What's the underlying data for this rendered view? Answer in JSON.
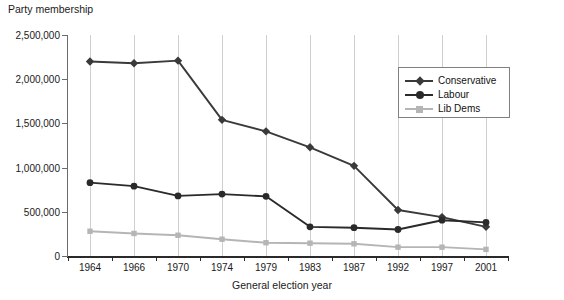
{
  "chart_data": {
    "type": "line",
    "title": "",
    "ylabel": "Party membership",
    "xlabel": "General election year",
    "categories": [
      "1964",
      "1966",
      "1970",
      "1974",
      "1979",
      "1983",
      "1987",
      "1992",
      "1997",
      "2001"
    ],
    "ylim": [
      0,
      2500000
    ],
    "yticks": [
      0,
      500000,
      1000000,
      1500000,
      2000000,
      2500000
    ],
    "ytick_labels": [
      "0",
      "500,000",
      "1,000,000",
      "1,500,000",
      "2,000,000",
      "2,500,000"
    ],
    "grid": "vertical",
    "legend_position": "top-right",
    "series": [
      {
        "name": "Conservative",
        "color": "#3a3a3a",
        "marker": "diamond",
        "values": [
          2200000,
          2180000,
          2210000,
          1540000,
          1410000,
          1230000,
          1020000,
          520000,
          440000,
          330000
        ]
      },
      {
        "name": "Labour",
        "color": "#2a2a2a",
        "marker": "circle",
        "values": [
          830000,
          790000,
          680000,
          700000,
          675000,
          330000,
          320000,
          300000,
          405000,
          380000
        ]
      },
      {
        "name": "Lib Dems",
        "color": "#b5b5b5",
        "marker": "square",
        "values": [
          280000,
          255000,
          235000,
          190000,
          150000,
          145000,
          138000,
          100000,
          100000,
          75000
        ]
      }
    ]
  },
  "legend": {
    "items": [
      {
        "label": "Conservative"
      },
      {
        "label": "Labour"
      },
      {
        "label": "Lib Dems"
      }
    ]
  },
  "axis": {
    "y_title": "Party membership",
    "x_title": "General election year"
  }
}
